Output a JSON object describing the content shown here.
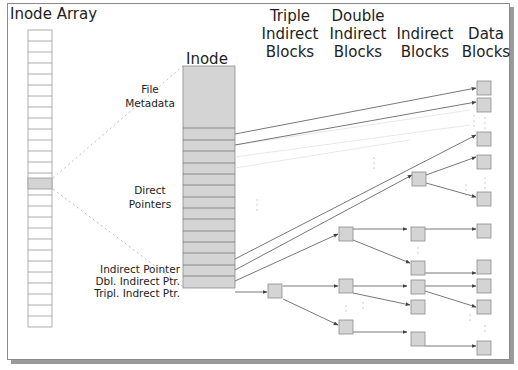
{
  "headers": {
    "inode_array": "Inode Array",
    "inode": "Inode",
    "triple_1": "Triple",
    "triple_2": "Indirect",
    "triple_3": "Blocks",
    "double_1": "Double",
    "double_2": "Indirect",
    "double_3": "Blocks",
    "indirect_1": "Indirect",
    "indirect_2": "Blocks",
    "data_1": "Data",
    "data_2": "Blocks"
  },
  "labels": {
    "file_metadata_1": "File",
    "file_metadata_2": "Metadata",
    "direct_1": "Direct",
    "direct_2": "Pointers",
    "indirect_pointer": "Indirect Pointer",
    "dbl_indirect": "Dbl. Indirect Ptr.",
    "tripl_indirect": "Tripl. Indrect Ptr."
  },
  "colors": {
    "block_fill": "#d4d4d4",
    "block_stroke": "#8c8c8c",
    "line": "#555555",
    "faint": "#c8c8c8"
  },
  "inode_array": {
    "rows": 28,
    "highlighted_row": 13
  },
  "inode": {
    "metadata_rows": 1,
    "direct_pointer_rows": 12,
    "indirect_rows": 3
  }
}
